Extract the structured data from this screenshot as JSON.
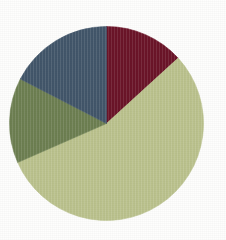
{
  "background_color": "#fefefd",
  "chart_data": {
    "type": "pie",
    "title": "",
    "subtitle": "",
    "xlabel": "",
    "ylabel": "",
    "legend_position": "none",
    "grid": false,
    "labels_visible": false,
    "start_angle_deg": 0,
    "direction": "clockwise",
    "center": {
      "x": 106.5,
      "y": 123.5
    },
    "radius": 97,
    "categories": [
      "Slice 1",
      "Slice 2",
      "Slice 3",
      "Slice 4"
    ],
    "values": [
      13.2,
      55.2,
      14.2,
      17.4
    ],
    "colors": [
      "#6b1428",
      "#bbc28d",
      "#6d7f51",
      "#42566a"
    ],
    "slices": [
      {
        "name": "Slice 1",
        "color_name": "dark-red",
        "color": "#6b1428",
        "value": 13.2,
        "start_angle_deg": 0.0,
        "end_angle_deg": 47.6
      },
      {
        "name": "Slice 2",
        "color_name": "light-sage-green",
        "color": "#bbc28d",
        "value": 55.2,
        "start_angle_deg": 47.6,
        "end_angle_deg": 246.3
      },
      {
        "name": "Slice 3",
        "color_name": "olive-green",
        "color": "#6d7f51",
        "value": 14.2,
        "start_angle_deg": 246.3,
        "end_angle_deg": 297.3
      },
      {
        "name": "Slice 4",
        "color_name": "slate-blue",
        "color": "#42566a",
        "value": 17.4,
        "start_angle_deg": 297.3,
        "end_angle_deg": 360.0
      }
    ]
  }
}
